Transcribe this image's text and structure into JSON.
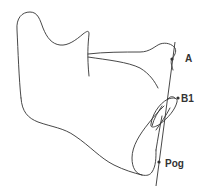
{
  "diagram": {
    "type": "cephalometric-mandible-tracing",
    "landmarks": [
      {
        "id": "A",
        "label": "A"
      },
      {
        "id": "B1",
        "label": "B1"
      },
      {
        "id": "Pog",
        "label": "Pog"
      }
    ],
    "reference_line": "line through A, B1 and Pog",
    "colors": {
      "stroke": "#333333",
      "background": "#ffffff"
    }
  }
}
